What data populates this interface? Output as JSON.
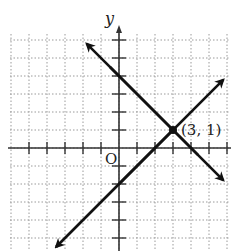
{
  "chart_data": {
    "type": "line",
    "title": "",
    "xlabel": "",
    "ylabel": "y",
    "origin_label": "O",
    "xlim": [
      -6,
      6
    ],
    "ylim": [
      -6,
      6
    ],
    "grid": true,
    "grid_style": "dotted",
    "series": [
      {
        "name": "line-decreasing",
        "equation": "y = -x + 4",
        "slope": -1,
        "intercept": 4,
        "x": [
          -1,
          6
        ],
        "y": [
          5,
          -2
        ]
      },
      {
        "name": "line-increasing",
        "equation": "y = x - 2",
        "slope": 1,
        "intercept": -2,
        "x": [
          -3,
          6
        ],
        "y": [
          -5,
          4
        ]
      }
    ],
    "annotations": [
      {
        "text": "(3, 1)",
        "x": 3,
        "y": 1,
        "marker": "point"
      }
    ]
  },
  "labels": {
    "y_axis": "y",
    "origin": "O",
    "point": "(3, 1)"
  },
  "colors": {
    "axes": "#333333",
    "lines": "#111111",
    "grid": "#999999"
  }
}
